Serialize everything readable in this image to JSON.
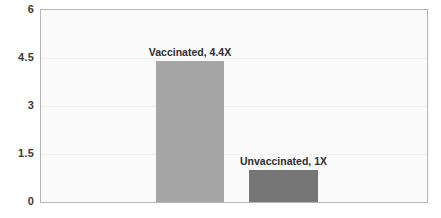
{
  "chart_data": {
    "type": "bar",
    "title": "",
    "subtitle": "",
    "xlabel": "",
    "ylabel": "",
    "categories": [
      "Vaccinated",
      "Unvaccinated"
    ],
    "values": [
      4.4,
      1.0
    ],
    "data_labels": [
      "Vaccinated, 4.4X",
      "Unvaccinated, 1X"
    ],
    "series": [
      {
        "name": "",
        "values": [
          4.4,
          1.0
        ]
      }
    ],
    "ylim": [
      0,
      6
    ],
    "yticks": [
      "0",
      "1.5",
      "3",
      "4.5",
      "6"
    ],
    "ytick_values": [
      0,
      1.5,
      3,
      4.5,
      6
    ],
    "xticks": [],
    "grid": true,
    "legend": false,
    "legend_position": "none",
    "bar_colors": [
      "#a6a6a6",
      "#767676"
    ],
    "plot_background": "#fafafa",
    "page_background": "#ffffff",
    "axis_label_color": "#3a3a3a",
    "data_label_color": "#2d2d2d",
    "border_color": "#b6b6b6",
    "gridline_color": "#f0f0f0"
  },
  "axis": {
    "y_tick_0": "0",
    "y_tick_1": "1.5",
    "y_tick_2": "3",
    "y_tick_3": "4.5",
    "y_tick_4": "6"
  },
  "labels": {
    "bar1": "Vaccinated, 4.4X",
    "bar2": "Unvaccinated, 1X"
  }
}
